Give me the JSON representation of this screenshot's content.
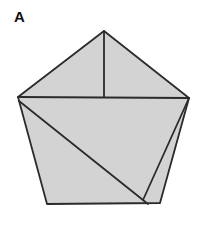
{
  "figure": {
    "label": "A",
    "label_position": {
      "x": 14,
      "y": 9
    },
    "canvas": {
      "width": 208,
      "height": 226
    },
    "background_color": "#ffffff",
    "fill_color": "#d3d3d3",
    "stroke_color": "#2b2b2b",
    "stroke_width": 1.8,
    "shape_type": "pentagon-subdivided",
    "vertices": {
      "apex": {
        "name": "apex",
        "x": 104,
        "y": 31
      },
      "left": {
        "name": "left",
        "x": 18,
        "y": 97
      },
      "right": {
        "name": "right",
        "x": 189,
        "y": 98
      },
      "bottom_left": {
        "name": "bottom-left",
        "x": 47,
        "y": 204
      },
      "bottom_right": {
        "name": "bottom-right",
        "x": 160,
        "y": 203
      }
    },
    "outline_points": "104,31 189,98 160,203 47,204 18,97",
    "internal_lines": [
      {
        "name": "apex-vertical-line",
        "description": "vertical segment from apex down to the horizontal chord",
        "x1": 104,
        "y1": 31,
        "x2": 104,
        "y2": 97
      },
      {
        "name": "horizontal-chord-line",
        "description": "horizontal chord connecting left and right vertices",
        "x1": 18,
        "y1": 97,
        "x2": 189,
        "y2": 98
      },
      {
        "name": "main-diagonal-line",
        "description": "long diagonal from left vertex to bottom-right area",
        "x1": 19,
        "y1": 101,
        "x2": 148,
        "y2": 204
      },
      {
        "name": "sliver-diagonal-line",
        "description": "short diagonal from right vertex to bottom-right area forming thin sliver",
        "x1": 189,
        "y1": 98,
        "x2": 143,
        "y2": 200
      }
    ]
  }
}
